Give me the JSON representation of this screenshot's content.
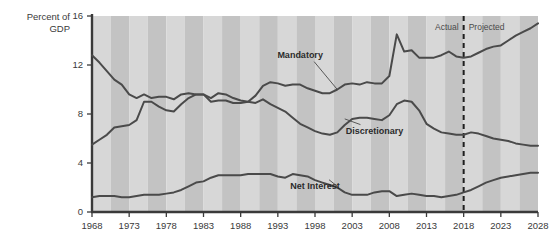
{
  "chart_data": {
    "type": "line",
    "title": "",
    "ylabel_line1": "Percent of",
    "ylabel_line2": "GDP",
    "xlabel": "",
    "xlim": [
      1968,
      2028
    ],
    "ylim": [
      0,
      16
    ],
    "yticks": [
      0,
      4,
      8,
      12,
      16
    ],
    "ytick_labels": [
      "0",
      "4",
      "8",
      "12",
      "16"
    ],
    "xticks": [
      1968,
      1973,
      1978,
      1983,
      1988,
      1993,
      1998,
      2003,
      2008,
      2013,
      2018,
      2023,
      2028
    ],
    "xtick_labels": [
      "1968",
      "1973",
      "1978",
      "1983",
      "1988",
      "1993",
      "1998",
      "2003",
      "2008",
      "2013",
      "2018",
      "2023",
      "2028"
    ],
    "grid": false,
    "band_shading": true,
    "legend_position": "inline-annotations",
    "divider": {
      "x": 2018,
      "left_label": "Actual",
      "right_label": "Projected"
    },
    "series": [
      {
        "name": "Mandatory",
        "label": "Mandatory",
        "color": "#4a4a4a",
        "x": [
          1968,
          1969,
          1970,
          1971,
          1972,
          1973,
          1974,
          1975,
          1976,
          1977,
          1978,
          1979,
          1980,
          1981,
          1982,
          1983,
          1984,
          1985,
          1986,
          1987,
          1988,
          1989,
          1990,
          1991,
          1992,
          1993,
          1994,
          1995,
          1996,
          1997,
          1998,
          1999,
          2000,
          2001,
          2002,
          2003,
          2004,
          2005,
          2006,
          2007,
          2008,
          2009,
          2010,
          2011,
          2012,
          2013,
          2014,
          2015,
          2016,
          2017,
          2018,
          2019,
          2020,
          2021,
          2022,
          2023,
          2024,
          2025,
          2026,
          2027,
          2028
        ],
        "values": [
          5.5,
          5.9,
          6.3,
          6.9,
          7.0,
          7.1,
          7.5,
          9.0,
          9.0,
          8.6,
          8.3,
          8.2,
          8.8,
          9.3,
          9.6,
          9.6,
          9.0,
          9.1,
          9.1,
          8.9,
          8.9,
          9.0,
          9.5,
          10.3,
          10.6,
          10.5,
          10.3,
          10.4,
          10.4,
          10.1,
          9.9,
          9.7,
          9.7,
          10.0,
          10.4,
          10.5,
          10.4,
          10.6,
          10.5,
          10.5,
          11.1,
          14.5,
          13.1,
          13.2,
          12.6,
          12.6,
          12.6,
          12.8,
          13.1,
          12.7,
          12.6,
          12.7,
          13.0,
          13.3,
          13.5,
          13.6,
          14.0,
          14.4,
          14.7,
          15.0,
          15.4
        ],
        "label_x": 1996,
        "label_y": 12.6,
        "anchor_x": 2001,
        "anchor_y": 10.0
      },
      {
        "name": "Discretionary",
        "label": "Discretionary",
        "color": "#4a4a4a",
        "x": [
          1968,
          1969,
          1970,
          1971,
          1972,
          1973,
          1974,
          1975,
          1976,
          1977,
          1978,
          1979,
          1980,
          1981,
          1982,
          1983,
          1984,
          1985,
          1986,
          1987,
          1988,
          1989,
          1990,
          1991,
          1992,
          1993,
          1994,
          1995,
          1996,
          1997,
          1998,
          1999,
          2000,
          2001,
          2002,
          2003,
          2004,
          2005,
          2006,
          2007,
          2008,
          2009,
          2010,
          2011,
          2012,
          2013,
          2014,
          2015,
          2016,
          2017,
          2018,
          2019,
          2020,
          2021,
          2022,
          2023,
          2024,
          2025,
          2026,
          2027,
          2028
        ],
        "values": [
          12.8,
          12.2,
          11.5,
          10.8,
          10.4,
          9.6,
          9.3,
          9.6,
          9.3,
          9.4,
          9.4,
          9.2,
          9.6,
          9.7,
          9.6,
          9.6,
          9.3,
          9.7,
          9.6,
          9.3,
          9.1,
          9.0,
          8.9,
          9.2,
          8.8,
          8.5,
          8.2,
          7.7,
          7.2,
          6.9,
          6.6,
          6.4,
          6.3,
          6.5,
          7.1,
          7.6,
          7.7,
          7.7,
          7.6,
          7.5,
          7.9,
          8.8,
          9.1,
          9.0,
          8.3,
          7.2,
          6.8,
          6.5,
          6.4,
          6.3,
          6.3,
          6.5,
          6.4,
          6.2,
          6.0,
          5.9,
          5.8,
          5.6,
          5.5,
          5.4,
          5.4
        ],
        "label_x": 2006,
        "label_y": 6.4,
        "anchor_x": 2002,
        "anchor_y": 7.6
      },
      {
        "name": "Net Interest",
        "label": "Net Interest",
        "color": "#5a5a5a",
        "x": [
          1968,
          1969,
          1970,
          1971,
          1972,
          1973,
          1974,
          1975,
          1976,
          1977,
          1978,
          1979,
          1980,
          1981,
          1982,
          1983,
          1984,
          1985,
          1986,
          1987,
          1988,
          1989,
          1990,
          1991,
          1992,
          1993,
          1994,
          1995,
          1996,
          1997,
          1998,
          1999,
          2000,
          2001,
          2002,
          2003,
          2004,
          2005,
          2006,
          2007,
          2008,
          2009,
          2010,
          2011,
          2012,
          2013,
          2014,
          2015,
          2016,
          2017,
          2018,
          2019,
          2020,
          2021,
          2022,
          2023,
          2024,
          2025,
          2026,
          2027,
          2028
        ],
        "values": [
          1.2,
          1.3,
          1.3,
          1.3,
          1.2,
          1.2,
          1.3,
          1.4,
          1.4,
          1.4,
          1.5,
          1.6,
          1.8,
          2.1,
          2.4,
          2.5,
          2.8,
          3.0,
          3.0,
          3.0,
          3.0,
          3.1,
          3.1,
          3.1,
          3.1,
          2.9,
          2.8,
          3.1,
          3.0,
          2.9,
          2.6,
          2.4,
          2.2,
          2.0,
          1.6,
          1.4,
          1.4,
          1.4,
          1.6,
          1.7,
          1.7,
          1.3,
          1.4,
          1.5,
          1.4,
          1.3,
          1.3,
          1.2,
          1.3,
          1.4,
          1.6,
          1.8,
          2.1,
          2.4,
          2.6,
          2.8,
          2.9,
          3.0,
          3.1,
          3.2,
          3.2
        ],
        "label_x": 1998,
        "label_y": 1.9,
        "anchor_x": 2001,
        "anchor_y": 2.1
      }
    ]
  }
}
